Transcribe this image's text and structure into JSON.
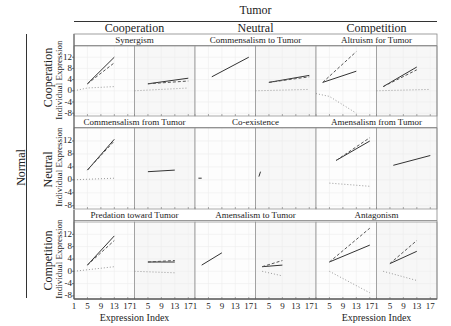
{
  "header": {
    "column_group_label": "Tumor",
    "row_group_label": "Normal",
    "columns": [
      "Cooperation",
      "Neutral",
      "Competition"
    ],
    "rows": [
      "Cooperation",
      "Neutral",
      "Competition"
    ],
    "y_axis_label": "Individual Expression",
    "x_axis_label": "Expression Index"
  },
  "cells": [
    [
      "Synergism",
      "Commensalism to Tumor",
      "Altruism for Tumor"
    ],
    [
      "Commensalism from Tumor",
      "Co-existence",
      "Amensalism from Tumor"
    ],
    [
      "Predation toward Tumor",
      "Amensalism to Tumor",
      "Antagonism"
    ]
  ],
  "y_ticks": [
    "12",
    "8",
    "4",
    "0",
    "-4",
    "-8"
  ],
  "x_ticks": [
    "1",
    "5",
    "9",
    "13",
    "17"
  ],
  "chart_data": {
    "type": "line",
    "title": "",
    "layout": "3x3 grid of cells (Normal interaction rows × Tumor interaction columns), each cell with 2 panels (left: normal, right: tumor)",
    "xlabel": "Expression Index",
    "ylabel": "Individual Expression",
    "xlim": [
      1,
      19
    ],
    "ylim": [
      -9,
      16
    ],
    "x_ticks": [
      1,
      5,
      9,
      13,
      17
    ],
    "y_ticks": [
      12,
      8,
      4,
      0,
      -4,
      -8
    ],
    "grid": true,
    "line_styles": {
      "solid": "total expression",
      "dashed": "component",
      "dotted": "component"
    },
    "panels": [
      {
        "cell": "Synergism",
        "panel": "left",
        "series": [
          {
            "style": "solid",
            "x": [
              5,
              13
            ],
            "y": [
              2.5,
              12
            ]
          },
          {
            "style": "dashed",
            "x": [
              5,
              13
            ],
            "y": [
              2.5,
              10
            ]
          },
          {
            "style": "dotted",
            "x": [
              1,
              5,
              13
            ],
            "y": [
              0,
              1,
              1.5
            ]
          }
        ]
      },
      {
        "cell": "Synergism",
        "panel": "right",
        "series": [
          {
            "style": "solid",
            "x": [
              5,
              17
            ],
            "y": [
              2.5,
              4.5
            ]
          },
          {
            "style": "dashed",
            "x": [
              5,
              17
            ],
            "y": [
              2.5,
              3.5
            ]
          },
          {
            "style": "dotted",
            "x": [
              1,
              17
            ],
            "y": [
              0,
              1
            ]
          }
        ]
      },
      {
        "cell": "Commensalism to Tumor",
        "panel": "left",
        "series": [
          {
            "style": "solid",
            "x": [
              6,
              17
            ],
            "y": [
              5,
              12
            ]
          }
        ]
      },
      {
        "cell": "Commensalism to Tumor",
        "panel": "right",
        "series": [
          {
            "style": "solid",
            "x": [
              5,
              17
            ],
            "y": [
              3,
              5.5
            ]
          },
          {
            "style": "dashed",
            "x": [
              5,
              17
            ],
            "y": [
              3,
              5
            ]
          },
          {
            "style": "dotted",
            "x": [
              1,
              17
            ],
            "y": [
              0,
              0.5
            ]
          }
        ]
      },
      {
        "cell": "Altruism for Tumor",
        "panel": "left",
        "series": [
          {
            "style": "solid",
            "x": [
              3,
              13
            ],
            "y": [
              3,
              7
            ]
          },
          {
            "style": "dashed",
            "x": [
              3,
              13
            ],
            "y": [
              3,
              14
            ]
          },
          {
            "style": "dotted",
            "x": [
              1,
              5,
              13
            ],
            "y": [
              -1,
              -2,
              -8
            ]
          }
        ]
      },
      {
        "cell": "Altruism for Tumor",
        "panel": "right",
        "series": [
          {
            "style": "solid",
            "x": [
              3,
              13
            ],
            "y": [
              1.5,
              8.5
            ]
          },
          {
            "style": "dashed",
            "x": [
              3,
              13
            ],
            "y": [
              1.5,
              7.5
            ]
          },
          {
            "style": "dotted",
            "x": [
              1,
              17
            ],
            "y": [
              0,
              0.5
            ]
          }
        ]
      },
      {
        "cell": "Commensalism from Tumor",
        "panel": "left",
        "series": [
          {
            "style": "solid",
            "x": [
              5,
              13
            ],
            "y": [
              3,
              12.5
            ]
          },
          {
            "style": "dashed",
            "x": [
              5,
              13
            ],
            "y": [
              3,
              12
            ]
          },
          {
            "style": "dotted",
            "x": [
              1,
              13
            ],
            "y": [
              0,
              0.5
            ]
          }
        ]
      },
      {
        "cell": "Commensalism from Tumor",
        "panel": "right",
        "series": [
          {
            "style": "solid",
            "x": [
              5,
              13
            ],
            "y": [
              2.5,
              3
            ]
          }
        ]
      },
      {
        "cell": "Co-existence",
        "panel": "left",
        "series": [
          {
            "style": "solid",
            "x": [
              2,
              3
            ],
            "y": [
              0.5,
              0.5
            ]
          }
        ]
      },
      {
        "cell": "Co-existence",
        "panel": "right",
        "series": [
          {
            "style": "solid",
            "x": [
              2,
              2.5
            ],
            "y": [
              1,
              2.5
            ]
          }
        ]
      },
      {
        "cell": "Amensalism from Tumor",
        "panel": "left",
        "series": [
          {
            "style": "solid",
            "x": [
              7,
              17
            ],
            "y": [
              6,
              12
            ]
          },
          {
            "style": "dashed",
            "x": [
              7,
              17
            ],
            "y": [
              6,
              13
            ]
          },
          {
            "style": "dotted",
            "x": [
              5,
              17
            ],
            "y": [
              -1,
              -2
            ]
          }
        ]
      },
      {
        "cell": "Amensalism from Tumor",
        "panel": "right",
        "series": [
          {
            "style": "solid",
            "x": [
              6,
              17
            ],
            "y": [
              4.5,
              7.5
            ]
          }
        ]
      },
      {
        "cell": "Predation toward Tumor",
        "panel": "left",
        "series": [
          {
            "style": "solid",
            "x": [
              5,
              13
            ],
            "y": [
              2,
              11.5
            ]
          },
          {
            "style": "dashed",
            "x": [
              5,
              13
            ],
            "y": [
              2,
              10
            ]
          },
          {
            "style": "dotted",
            "x": [
              1,
              13
            ],
            "y": [
              0,
              1.5
            ]
          }
        ]
      },
      {
        "cell": "Predation toward Tumor",
        "panel": "right",
        "series": [
          {
            "style": "solid",
            "x": [
              5,
              13
            ],
            "y": [
              3,
              3
            ]
          },
          {
            "style": "dashed",
            "x": [
              5,
              13
            ],
            "y": [
              3,
              3.5
            ]
          },
          {
            "style": "dotted",
            "x": [
              1,
              13
            ],
            "y": [
              0,
              -0.5
            ]
          }
        ]
      },
      {
        "cell": "Amensalism to Tumor",
        "panel": "left",
        "series": [
          {
            "style": "solid",
            "x": [
              3,
              9
            ],
            "y": [
              2,
              6
            ]
          }
        ]
      },
      {
        "cell": "Amensalism to Tumor",
        "panel": "right",
        "series": [
          {
            "style": "solid",
            "x": [
              3,
              9
            ],
            "y": [
              1.5,
              2
            ]
          },
          {
            "style": "dashed",
            "x": [
              3,
              9
            ],
            "y": [
              1.5,
              3.5
            ]
          },
          {
            "style": "dotted",
            "x": [
              3,
              9
            ],
            "y": [
              0,
              -1.5
            ]
          }
        ]
      },
      {
        "cell": "Antagonism",
        "panel": "left",
        "series": [
          {
            "style": "solid",
            "x": [
              5,
              17
            ],
            "y": [
              3,
              8.5
            ]
          },
          {
            "style": "dashed",
            "x": [
              5,
              17
            ],
            "y": [
              3,
              14
            ]
          },
          {
            "style": "dotted",
            "x": [
              5,
              17
            ],
            "y": [
              0,
              -7
            ]
          }
        ]
      },
      {
        "cell": "Antagonism",
        "panel": "right",
        "series": [
          {
            "style": "solid",
            "x": [
              5,
              13
            ],
            "y": [
              2.5,
              6.5
            ]
          },
          {
            "style": "dashed",
            "x": [
              5,
              13
            ],
            "y": [
              2.5,
              10
            ]
          },
          {
            "style": "dotted",
            "x": [
              3,
              13
            ],
            "y": [
              0,
              -3
            ]
          }
        ]
      }
    ]
  }
}
